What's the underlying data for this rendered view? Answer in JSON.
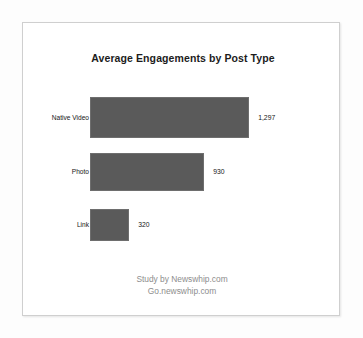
{
  "figure": {
    "background": "#ffffff",
    "frame_color": "#cfcfcf"
  },
  "footer": {
    "line1": "Study by Newswhip.com",
    "line2": "Go.newswhip.com",
    "color": "#8d8d8d"
  },
  "chart_data": {
    "type": "bar",
    "orientation": "horizontal",
    "title": "Average Engagements by Post Type",
    "xlabel": "",
    "ylabel": "",
    "categories": [
      "Native Video",
      "Photo",
      "Link"
    ],
    "values": [
      1297,
      930,
      320
    ],
    "value_labels": [
      "1,297",
      "930",
      "320"
    ],
    "xlim": [
      0,
      1450
    ],
    "grid": false,
    "legend": false,
    "bar_color": "#5a5a5a",
    "bar_edge_color": "#6e6e6e",
    "series": [
      {
        "name": "Average Engagements",
        "values": [
          1297,
          930,
          320
        ]
      }
    ]
  }
}
